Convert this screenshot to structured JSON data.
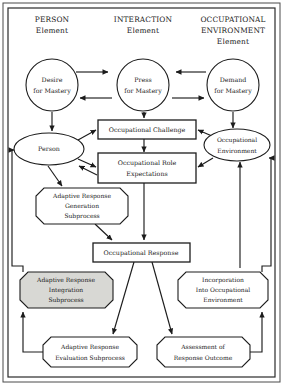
{
  "diagram": {
    "headers": [
      {
        "id": "person-element",
        "line1": "PERSON",
        "line2": "Element",
        "line3": ""
      },
      {
        "id": "interaction-element",
        "line1": "INTERACTION",
        "line2": "Element",
        "line3": ""
      },
      {
        "id": "occupational-environment-element",
        "line1": "OCCUPATIONAL",
        "line2": "ENVIRONMENT",
        "line3": "Element"
      }
    ],
    "nodes": {
      "desire_for_mastery": {
        "line1": "Desire",
        "line2": "for Mastery",
        "shape": "circle"
      },
      "press_for_mastery": {
        "line1": "Press",
        "line2": "for Mastery",
        "shape": "circle"
      },
      "demand_for_mastery": {
        "line1": "Demand",
        "line2": "for Mastery",
        "shape": "circle"
      },
      "person": {
        "line1": "Person",
        "line2": "",
        "shape": "ellipse"
      },
      "occupational_environment": {
        "line1": "Occupational",
        "line2": "Environment",
        "shape": "ellipse"
      },
      "occupational_challenge": {
        "line1": "Occupational Challenge",
        "line2": "",
        "shape": "rect"
      },
      "occupational_role_expectations": {
        "line1": "Occupational Role",
        "line2": "Expectations",
        "shape": "rect"
      },
      "occupational_response": {
        "line1": "Occupational Response",
        "line2": "",
        "shape": "rect"
      },
      "adaptive_response_generation_subprocess": {
        "line1": "Adaptive Response",
        "line2": "Generation",
        "line3": "Subprocess",
        "shape": "octagon"
      },
      "adaptive_response_integration_subprocess": {
        "line1": "Adaptive Response",
        "line2": "Integration",
        "line3": "Subprocess",
        "shape": "octagon-shaded"
      },
      "incorporation_into_occupational_environment": {
        "line1": "Incorporation",
        "line2": "Into Occupational",
        "line3": "Environment",
        "shape": "octagon"
      },
      "adaptive_response_evaluation_subprocess": {
        "line1": "Adaptive Response",
        "line2": "Evaluation Subprocess",
        "shape": "octagon"
      },
      "assessment_of_response_outcome": {
        "line1": "Assessment of",
        "line2": "Response Outcome",
        "shape": "octagon"
      }
    },
    "colors": {
      "stroke": "#1c1c1c",
      "shaded_fill": "#d8d8d4",
      "background": "#ffffff",
      "frame": "#2a2a2a"
    }
  }
}
